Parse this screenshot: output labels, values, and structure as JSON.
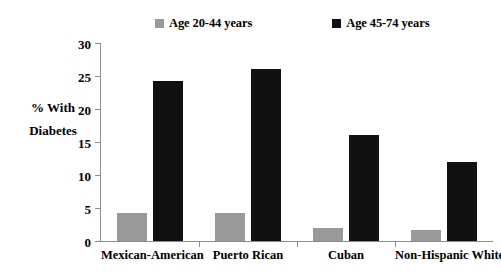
{
  "chart_data": {
    "type": "bar",
    "title": "",
    "xlabel": "",
    "ylabel": "% With Diabetes",
    "ylim": [
      0,
      30
    ],
    "yticks": [
      0,
      5,
      10,
      15,
      20,
      25,
      30
    ],
    "grid": false,
    "legend_position": "top",
    "categories": [
      "Mexican-American",
      "Puerto Rican",
      "Cuban",
      "Non-Hispanic White"
    ],
    "series": [
      {
        "name": "Age 20-44 years",
        "color": "#999999",
        "values": [
          4.3,
          4.3,
          2.0,
          1.7
        ]
      },
      {
        "name": "Age 45-74 years",
        "color": "#111111",
        "values": [
          24.2,
          26.0,
          16.1,
          12.0
        ]
      }
    ]
  },
  "axis": {
    "ylabel_line1": "% With",
    "ylabel_line2": "Diabetes",
    "ytick_labels": [
      "0",
      "5",
      "10",
      "15",
      "20",
      "25",
      "30"
    ]
  },
  "legend": {
    "entries": [
      {
        "label": "Age 20-44 years",
        "color": "#999999"
      },
      {
        "label": "Age 45-74 years",
        "color": "#111111"
      }
    ]
  }
}
